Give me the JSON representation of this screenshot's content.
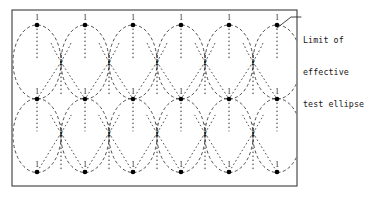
{
  "figure": {
    "background_color": "#ffffff",
    "frame": {
      "x": 12,
      "y": 10,
      "width": 285,
      "height": 176,
      "stroke_color": "#3b3b3b"
    },
    "grid": {
      "columns": 6,
      "rows": 2,
      "column_centers_x": [
        37,
        85,
        133,
        181,
        229,
        277
      ],
      "row_band_top": {
        "pole_top_y": 25,
        "cusp_y": 62,
        "pole_bottom_y": 99
      },
      "row_band_bottom": {
        "pole_top_y": 99,
        "cusp_y": 133,
        "pole_bottom_y": 172
      },
      "ellipse_rx": 24,
      "ellipse_ry": 37,
      "cusp_centers_x": [
        61,
        109,
        157,
        205,
        253
      ]
    },
    "ellipse_style": {
      "stroke_color": "#2e2e2e",
      "dash_pattern": "dashed",
      "description": "limit of effective test ellipse"
    },
    "arc_style": {
      "stroke_color": "#1f1f1f",
      "dash_pattern": "dotted"
    },
    "node_dot_color": "#000000",
    "node_dot_radius": 2.3
  },
  "labels": {
    "pole_label": "1",
    "cusp_label": "2",
    "top_row_pole_labels": [
      "1",
      "1",
      "1",
      "1",
      "1",
      "1"
    ],
    "middle_row_pole_labels": [
      "1",
      "1",
      "1",
      "1",
      "1",
      "1"
    ],
    "bottom_row_pole_labels": [
      "1",
      "1",
      "1",
      "1",
      "1",
      "1"
    ],
    "top_band_cusp_labels": [
      "2",
      "2",
      "2",
      "2",
      "2"
    ],
    "bottom_band_cusp_labels": [
      "2",
      "2",
      "2",
      "2",
      "2"
    ]
  },
  "annotation": {
    "name": "limit-of-effective-test-ellipse",
    "lines": [
      "Limit of",
      "effective",
      "test ellipse"
    ],
    "line_1": "Limit of",
    "line_2": "effective",
    "line_3": "test ellipse",
    "text_x": 303,
    "text_y": 14,
    "leader": {
      "from_x": 301,
      "from_y": 17,
      "elbow_x": 291,
      "elbow_y": 17,
      "to_x": 277,
      "to_y": 28
    }
  }
}
